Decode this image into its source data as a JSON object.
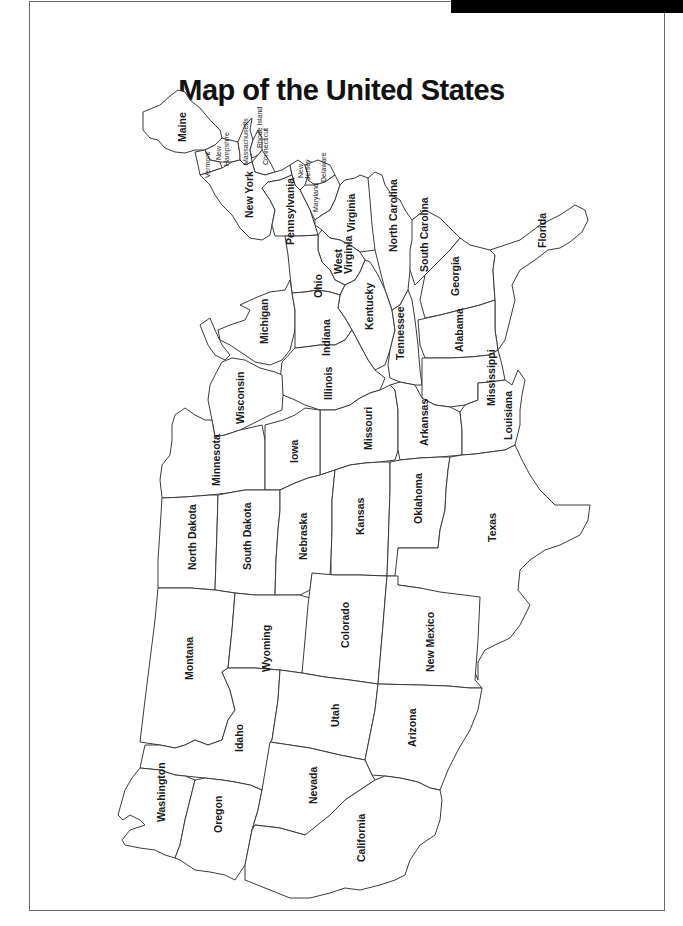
{
  "title": "Map of the United States",
  "header_bar": {
    "color": "#000000"
  },
  "map": {
    "orientation": "rotated 90 degrees (east at top, west at bottom)",
    "line_color": "#3a3a3a",
    "fill_color": "#ffffff",
    "states": [
      {
        "name": "Maine",
        "label": "Maine"
      },
      {
        "name": "New Hampshire",
        "label": "New Hampshire"
      },
      {
        "name": "Vermont",
        "label": "Vermont"
      },
      {
        "name": "Massachusetts",
        "label": "Massachusetts"
      },
      {
        "name": "Rhode Island",
        "label": "Rhode Island"
      },
      {
        "name": "Connecticut",
        "label": "Connecticut"
      },
      {
        "name": "New York",
        "label": "New York"
      },
      {
        "name": "New Jersey",
        "label": "New Jersey"
      },
      {
        "name": "Delaware",
        "label": "Delaware"
      },
      {
        "name": "Maryland",
        "label": "Maryland"
      },
      {
        "name": "Pennsylvania",
        "label": "Pennsylvania"
      },
      {
        "name": "Virginia",
        "label": "Virginia"
      },
      {
        "name": "West Virginia",
        "label": "West Virginia"
      },
      {
        "name": "North Carolina",
        "label": "North Carolina"
      },
      {
        "name": "South Carolina",
        "label": "South Carolina"
      },
      {
        "name": "Georgia",
        "label": "Georgia"
      },
      {
        "name": "Florida",
        "label": "Florida"
      },
      {
        "name": "Ohio",
        "label": "Ohio"
      },
      {
        "name": "Kentucky",
        "label": "Kentucky"
      },
      {
        "name": "Tennessee",
        "label": "Tennessee"
      },
      {
        "name": "Alabama",
        "label": "Alabama"
      },
      {
        "name": "Mississippi",
        "label": "Mississippi"
      },
      {
        "name": "Michigan",
        "label": "Michigan"
      },
      {
        "name": "Indiana",
        "label": "Indiana"
      },
      {
        "name": "Illinois",
        "label": "Illinois"
      },
      {
        "name": "Wisconsin",
        "label": "Wisconsin"
      },
      {
        "name": "Missouri",
        "label": "Missouri"
      },
      {
        "name": "Arkansas",
        "label": "Arkansas"
      },
      {
        "name": "Louisiana",
        "label": "Louisiana"
      },
      {
        "name": "Minnesota",
        "label": "Minnesota"
      },
      {
        "name": "Iowa",
        "label": "Iowa"
      },
      {
        "name": "North Dakota",
        "label": "North Dakota"
      },
      {
        "name": "South Dakota",
        "label": "South Dakota"
      },
      {
        "name": "Nebraska",
        "label": "Nebraska"
      },
      {
        "name": "Kansas",
        "label": "Kansas"
      },
      {
        "name": "Oklahoma",
        "label": "Oklahoma"
      },
      {
        "name": "Texas",
        "label": "Texas"
      },
      {
        "name": "Montana",
        "label": "Montana"
      },
      {
        "name": "Wyoming",
        "label": "Wyoming"
      },
      {
        "name": "Colorado",
        "label": "Colorado"
      },
      {
        "name": "New Mexico",
        "label": "New Mexico"
      },
      {
        "name": "Idaho",
        "label": "Idaho"
      },
      {
        "name": "Utah",
        "label": "Utah"
      },
      {
        "name": "Arizona",
        "label": "Arizona"
      },
      {
        "name": "Washington",
        "label": "Washington"
      },
      {
        "name": "Oregon",
        "label": "Oregon"
      },
      {
        "name": "Nevada",
        "label": "Nevada"
      },
      {
        "name": "California",
        "label": "California"
      }
    ]
  }
}
